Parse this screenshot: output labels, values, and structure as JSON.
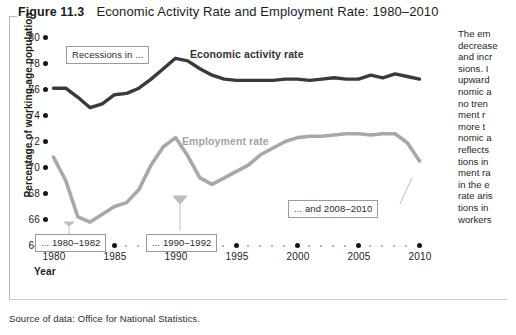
{
  "header": {
    "figure_number": "Figure 11.3",
    "title": "Economic Activity Rate and Employment Rate: 1980–2010"
  },
  "source_note": "Source of data: Office for National Statistics.",
  "axis": {
    "y_title": "Percentage of working-age population",
    "x_title": "Year"
  },
  "labels": {
    "activity": "Economic activity rate",
    "employment": "Employment rate"
  },
  "callouts": [
    {
      "id": "recessions",
      "text": "Recessions in ..."
    },
    {
      "id": "r1980",
      "text": "... 1980–1982"
    },
    {
      "id": "r1990",
      "text": "... 1990–1992"
    },
    {
      "id": "r2008",
      "text": "... and 2008–2010"
    }
  ],
  "side_text": "The em decrease and incr sions. I upward nomic a no tren ment r more t nomic a reflects tions in ment ra in the e rate aris tions in workers",
  "side_lines": [
    "The  em",
    "decrease",
    "and incr",
    "sions.  I",
    "upward",
    "nomic a",
    "no tren",
    "ment   r",
    "more  t",
    "nomic a",
    "reflects",
    "tions in",
    "ment ra",
    "in the e",
    "rate aris",
    "tions in",
    "workers"
  ],
  "colors": {
    "activity_line": "#3a3a3a",
    "employment_line": "#a8a8a8",
    "axis_dot": "#161616",
    "minor_dot": "#9d9d9d",
    "callout_border": "#9a9a9a",
    "frame": "#b9b9b9"
  },
  "chart_data": {
    "type": "line",
    "title": "Economic Activity Rate and Employment Rate: 1980–2010",
    "xlabel": "Year",
    "ylabel": "Percentage of working-age population",
    "xlim": [
      1980,
      2010
    ],
    "ylim": [
      64,
      80
    ],
    "yticks": [
      64,
      66,
      68,
      70,
      72,
      74,
      76,
      78,
      80
    ],
    "xticks": [
      1980,
      1985,
      1990,
      1995,
      2000,
      2005,
      2010
    ],
    "grid": false,
    "legend": "inline-labels",
    "x": [
      1980,
      1981,
      1982,
      1983,
      1984,
      1985,
      1986,
      1987,
      1988,
      1989,
      1990,
      1991,
      1992,
      1993,
      1994,
      1995,
      1996,
      1997,
      1998,
      1999,
      2000,
      2001,
      2002,
      2003,
      2004,
      2005,
      2006,
      2007,
      2008,
      2009,
      2010
    ],
    "series": [
      {
        "name": "Economic activity rate",
        "color": "#3a3a3a",
        "values": [
          76.1,
          76.1,
          75.4,
          74.6,
          74.9,
          75.6,
          75.7,
          76.1,
          76.8,
          77.6,
          78.4,
          78.2,
          77.6,
          77.1,
          76.8,
          76.7,
          76.7,
          76.7,
          76.7,
          76.8,
          76.8,
          76.7,
          76.8,
          76.9,
          76.8,
          76.8,
          77.1,
          76.9,
          77.2,
          77.0,
          76.8
        ]
      },
      {
        "name": "Employment rate",
        "color": "#a8a8a8",
        "values": [
          70.8,
          69.0,
          66.2,
          65.8,
          66.4,
          67.0,
          67.3,
          68.3,
          70.2,
          71.6,
          72.3,
          70.9,
          69.2,
          68.7,
          69.2,
          69.7,
          70.2,
          71.0,
          71.5,
          72.0,
          72.3,
          72.4,
          72.4,
          72.5,
          72.6,
          72.6,
          72.5,
          72.6,
          72.6,
          71.9,
          70.5
        ]
      }
    ],
    "annotations": [
      {
        "text": "Recessions in ...",
        "x": 1982.6,
        "y": 79.1
      },
      {
        "text": "... 1980–1982",
        "x": 1982.0,
        "y": 65.1,
        "points_to": [
          1981.5,
          66.6
        ]
      },
      {
        "text": "... 1990–1992",
        "x": 1991.5,
        "y": 65.1,
        "points_to": [
          1991.0,
          69.8
        ]
      },
      {
        "text": "... and 2008–2010",
        "x": 2003.5,
        "y": 67.4,
        "points_to": [
          2009.0,
          71.6
        ]
      }
    ]
  }
}
